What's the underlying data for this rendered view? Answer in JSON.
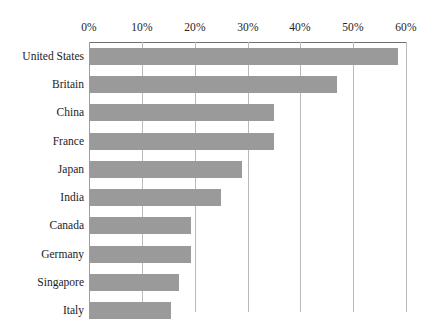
{
  "chart_data": {
    "type": "bar",
    "orientation": "horizontal",
    "title": "",
    "subtitle": "",
    "xlabel": "",
    "ylabel": "",
    "categories": [
      "United States",
      "Britain",
      "China",
      "France",
      "Japan",
      "India",
      "Canada",
      "Germany",
      "Singapore",
      "Italy"
    ],
    "values": [
      58.5,
      47,
      35,
      35,
      29,
      25,
      19.3,
      19.3,
      17,
      15.5
    ],
    "series": [
      {
        "name": "",
        "values": [
          58.5,
          47,
          35,
          35,
          29,
          25,
          19.3,
          19.3,
          17,
          15.5
        ]
      }
    ],
    "xlim": [
      0,
      60
    ],
    "xticks": [
      0,
      10,
      20,
      30,
      40,
      50,
      60
    ],
    "xtick_labels": [
      "0%",
      "10%",
      "20%",
      "30%",
      "40%",
      "50%",
      "60%"
    ],
    "grid": "vertical",
    "legend": "none",
    "bar_color": "#9a9a9a",
    "gridline_color": "#b9b9b9",
    "axis_color": "#6f6f6f",
    "background_color": "#ffffff",
    "annotations": []
  }
}
